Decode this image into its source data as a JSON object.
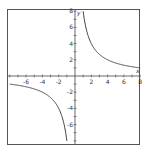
{
  "chart_data": {
    "type": "line",
    "title": "",
    "xlabel": "x",
    "ylabel": "y",
    "xlim": [
      -8,
      8
    ],
    "ylim": [
      -8,
      8
    ],
    "grid": false,
    "legend": null,
    "x_ticks": [
      -6,
      -4,
      -2,
      2,
      4,
      6,
      8
    ],
    "y_ticks": [
      8,
      6,
      4,
      2,
      -2,
      -4,
      -6
    ],
    "series": [
      {
        "name": "y = 8/x",
        "function": "8/x",
        "x": [
          -8,
          -6,
          -4,
          -2,
          -1,
          1,
          2,
          4,
          6,
          8
        ],
        "y": [
          -1,
          -1.333,
          -2,
          -4,
          -8,
          8,
          4,
          2,
          1.333,
          1
        ],
        "color": "#444444"
      }
    ]
  },
  "colors": {
    "frame": "#555555",
    "axis": "#444444",
    "curve": "#444444"
  }
}
